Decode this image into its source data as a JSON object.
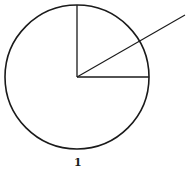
{
  "figure": {
    "label": "1",
    "stroke_color": "#1a1a1a",
    "background": "#ffffff",
    "circle": {
      "cx": 77,
      "cy": 77,
      "r": 72
    },
    "segments": [
      {
        "name": "vertical-radius",
        "x1": 77,
        "y1": 77,
        "x2": 77,
        "y2": 5
      },
      {
        "name": "horizontal-radius",
        "x1": 77,
        "y1": 77,
        "x2": 149,
        "y2": 77
      },
      {
        "name": "diagonal-ray",
        "x1": 77,
        "y1": 77,
        "x2": 185,
        "y2": 15
      }
    ]
  }
}
